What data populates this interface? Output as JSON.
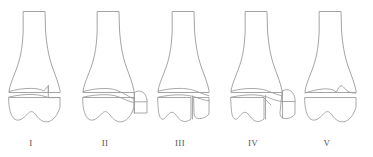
{
  "diagram": {
    "background_color": "#ffffff",
    "line_color": "#9a9a9a",
    "label_color": "#555555",
    "figure_count": 5,
    "figures": [
      {
        "label": "I",
        "label_x": 31,
        "label_y": 146,
        "description": "Intact distal tibia with undisplaced transverse fracture line through the plafond"
      },
      {
        "label": "II",
        "label_x": 105,
        "label_y": 146,
        "description": "Distal tibia with oblique lateral fragment split from the plafond"
      },
      {
        "label": "III",
        "label_x": 180,
        "label_y": 146,
        "description": "Distal tibia with separate lateral articular block and transverse plafond line"
      },
      {
        "label": "IV",
        "label_x": 253,
        "label_y": 146,
        "description": "Distal tibia with comminuted lateral column and crossing fracture lines"
      },
      {
        "label": "V",
        "label_x": 327,
        "label_y": 146,
        "description": "Distal tibia with irregular impacted plafond, single displaced epiphyseal block"
      }
    ]
  }
}
